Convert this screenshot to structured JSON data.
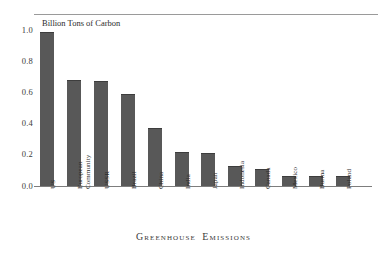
{
  "chart_data": {
    "type": "bar",
    "title": "Greenhouse Emissions",
    "axis_title": "Billion Tons of Carbon",
    "xlabel": "",
    "ylabel": "Billion Tons of Carbon",
    "ylim": [
      0.0,
      1.0
    ],
    "yticks": [
      "1.0",
      "0.8",
      "0.6",
      "0.4",
      "0.2",
      "0.0"
    ],
    "ytick_values": [
      1.0,
      0.8,
      0.6,
      0.4,
      0.2,
      0.0
    ],
    "grid": false,
    "legend": "none",
    "bar_color": "#585858",
    "categories": [
      "US",
      "European Community",
      "USSR",
      "Brazil",
      "China",
      "India",
      "Japan",
      "Indonesia",
      "Canada",
      "Mexico",
      "Burma",
      "Poland"
    ],
    "values": [
      0.99,
      0.68,
      0.67,
      0.59,
      0.37,
      0.215,
      0.21,
      0.13,
      0.11,
      0.065,
      0.065,
      0.065
    ]
  },
  "caption": {
    "text": "Greenhouse Emissions"
  }
}
